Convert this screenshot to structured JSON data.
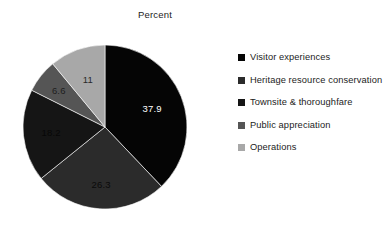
{
  "chart_data": {
    "type": "pie",
    "title": "Percent",
    "xlabel": "",
    "ylabel": "",
    "legend_position": "right",
    "grid": false,
    "start_angle_deg": 0,
    "direction": "clockwise",
    "categories": [
      "Visitor experiences",
      "Heritage resource conservation",
      "Townsite & thoroughfare",
      "Public appreciation",
      "Operations"
    ],
    "values": [
      37.9,
      26.3,
      18.2,
      6.6,
      11
    ],
    "data_labels": [
      "37.9",
      "26.3",
      "18.2",
      "6.6",
      "11"
    ],
    "colors": [
      "#050505",
      "#2b2b2b",
      "#151515",
      "#555555",
      "#a8a8a8"
    ],
    "label_text_colors": [
      "#ffffff",
      "#0a0a0a",
      "#070707",
      "#1e1e1e",
      "#2a2a2a"
    ]
  },
  "legend": {
    "items": [
      {
        "label": "Visitor experiences",
        "color": "#050505"
      },
      {
        "label": "Heritage resource conservation",
        "color": "#2b2b2b"
      },
      {
        "label": "Townsite & thoroughfare",
        "color": "#151515"
      },
      {
        "label": "Public appreciation",
        "color": "#555555"
      },
      {
        "label": "Operations",
        "color": "#a8a8a8"
      }
    ]
  }
}
